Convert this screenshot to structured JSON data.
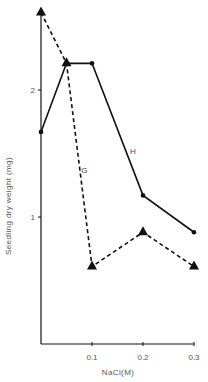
{
  "chart_data": {
    "type": "line",
    "title": "",
    "xlabel": "NaCl(M)",
    "ylabel": "Seedling dry weight (mg)",
    "x": [
      0,
      0.05,
      0.1,
      0.2,
      0.3
    ],
    "xticks": [
      "0.1",
      "0.2",
      "0.3"
    ],
    "yticks": [
      "1",
      "2"
    ],
    "xlim": [
      0,
      0.3
    ],
    "ylim": [
      0,
      2.65
    ],
    "grid": false,
    "legend": "inline labels",
    "series": [
      {
        "name": "H",
        "style": "solid",
        "marker": "circle",
        "values": [
          1.67,
          2.21,
          2.21,
          1.17,
          0.88
        ]
      },
      {
        "name": "G",
        "style": "dashed",
        "marker": "triangle",
        "values": [
          2.61,
          2.21,
          0.61,
          0.88,
          0.61
        ]
      }
    ],
    "annotations": [
      {
        "text": "H",
        "near_x": 0.18,
        "near_y": 1.5
      },
      {
        "text": "G",
        "near_x": 0.085,
        "near_y": 1.35
      }
    ]
  }
}
